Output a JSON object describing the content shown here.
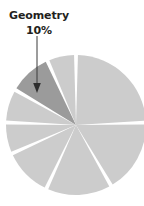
{
  "figure": {
    "width": 144,
    "height": 206,
    "background": "#ffffff"
  },
  "annotation": {
    "category_label": "Geometry",
    "value_label": "10%",
    "text_color": "#231f20",
    "leader_line_color": "#3a3a3a",
    "points_to_slice": "Geometry"
  },
  "chart_data": {
    "type": "pie",
    "title": "",
    "categories": [
      "Geometry"
    ],
    "values": [
      10
    ],
    "labels_shown": [
      "Geometry 10%"
    ],
    "legend": "none",
    "slice_count": 7,
    "highlight_color": "#9b9b9b",
    "default_slice_color": "#cccccc",
    "slice_gap_color": "#ffffff",
    "center_x": 76,
    "center_y": 125,
    "radius": 70,
    "start_angle_deg": 0,
    "slices": [
      {
        "name": "slice-1",
        "start_deg": 0,
        "end_deg": 88,
        "color": "#cccccc",
        "highlighted": false
      },
      {
        "name": "slice-2",
        "start_deg": 88,
        "end_deg": 150,
        "color": "#cccccc",
        "highlighted": false
      },
      {
        "name": "slice-3",
        "start_deg": 150,
        "end_deg": 205,
        "color": "#cccccc",
        "highlighted": false
      },
      {
        "name": "slice-4",
        "start_deg": 205,
        "end_deg": 246,
        "color": "#cccccc",
        "highlighted": false
      },
      {
        "name": "slice-5",
        "start_deg": 246,
        "end_deg": 272,
        "color": "#cccccc",
        "highlighted": false
      },
      {
        "name": "slice-6",
        "start_deg": 272,
        "end_deg": 300,
        "color": "#cccccc",
        "highlighted": false
      },
      {
        "name": "Geometry",
        "start_deg": 300,
        "end_deg": 336,
        "color": "#9b9b9b",
        "highlighted": true
      },
      {
        "name": "slice-7",
        "start_deg": 336,
        "end_deg": 360,
        "color": "#cccccc",
        "highlighted": false
      }
    ]
  }
}
